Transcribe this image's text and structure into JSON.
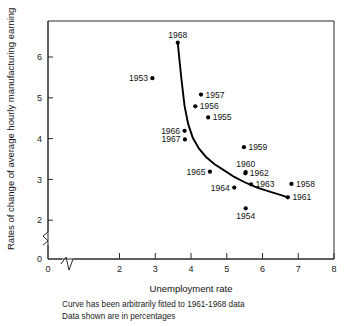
{
  "chart_data": {
    "type": "scatter",
    "title": "",
    "xlabel": "Unemployment rate",
    "ylabel": "Rates of change of average hourly manufacturing earning",
    "xlim": [
      0,
      8
    ],
    "ylim": [
      0,
      6.8
    ],
    "grid": false,
    "legend": "none",
    "axis_break_x": true,
    "axis_break_y": true,
    "xticks": [
      0,
      2,
      3,
      4,
      5,
      6,
      7,
      8
    ],
    "xticklabels": [
      "0",
      "2",
      "3",
      "4",
      "5",
      "6",
      "7",
      "8"
    ],
    "yticks": [
      0,
      2,
      3,
      4,
      5,
      6
    ],
    "yticklabels": [
      "0",
      "2",
      "3",
      "4",
      "5",
      "6"
    ],
    "points": [
      {
        "label": "1968",
        "x": 3.63,
        "y": 6.35,
        "label_pos": "above"
      },
      {
        "label": "1953",
        "x": 2.92,
        "y": 5.48,
        "label_pos": "left"
      },
      {
        "label": "1957",
        "x": 4.28,
        "y": 5.08,
        "label_pos": "right"
      },
      {
        "label": "1956",
        "x": 4.12,
        "y": 4.79,
        "label_pos": "right"
      },
      {
        "label": "1955",
        "x": 4.48,
        "y": 4.52,
        "label_pos": "right"
      },
      {
        "label": "1966",
        "x": 3.82,
        "y": 4.19,
        "label_pos": "left"
      },
      {
        "label": "1967",
        "x": 3.83,
        "y": 3.98,
        "label_pos": "left"
      },
      {
        "label": "1959",
        "x": 5.48,
        "y": 3.79,
        "label_pos": "right"
      },
      {
        "label": "1960",
        "x": 5.53,
        "y": 3.18,
        "label_pos": "above"
      },
      {
        "label": "1962",
        "x": 5.52,
        "y": 3.15,
        "label_pos": "right"
      },
      {
        "label": "1965",
        "x": 4.53,
        "y": 3.19,
        "label_pos": "left"
      },
      {
        "label": "1963",
        "x": 5.68,
        "y": 2.88,
        "label_pos": "right"
      },
      {
        "label": "1958",
        "x": 6.81,
        "y": 2.89,
        "label_pos": "right"
      },
      {
        "label": "1964",
        "x": 5.21,
        "y": 2.8,
        "label_pos": "left"
      },
      {
        "label": "1961",
        "x": 6.71,
        "y": 2.56,
        "label_pos": "right"
      },
      {
        "label": "1954",
        "x": 5.53,
        "y": 2.29,
        "label_pos": "below"
      }
    ],
    "fitted_curve": {
      "name": "Curve arbitrarily fitted to 1961-1968 data",
      "x": [
        3.63,
        3.68,
        3.74,
        3.82,
        3.92,
        4.05,
        4.22,
        4.42,
        4.66,
        4.95,
        5.21,
        5.5,
        5.85,
        6.2,
        6.5,
        6.71
      ],
      "y": [
        6.35,
        5.9,
        5.4,
        4.8,
        4.36,
        4.02,
        3.76,
        3.55,
        3.37,
        3.21,
        3.06,
        2.93,
        2.8,
        2.7,
        2.62,
        2.56
      ]
    },
    "annotations": [
      "Curve has been arbitrarily fitted to 1961-1968 data",
      "Data shown are in percentages"
    ]
  },
  "caption": {
    "line1": "Curve has been arbitrarily fitted to 1961-1968 data",
    "line2": "Data shown are in percentages"
  },
  "colors": {
    "ink": "#111111",
    "axis": "#2b2b2b",
    "background": "#ffffff"
  }
}
